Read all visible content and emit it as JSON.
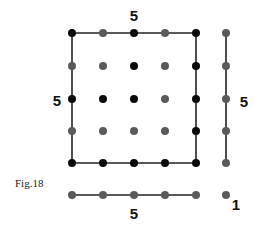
{
  "figure": {
    "caption": "Fig.18",
    "caption_pos": [
      15,
      183
    ],
    "colors": {
      "black": "#0a0a0a",
      "gray": "#5a5a5a",
      "line": "#222222"
    },
    "dot_radius": 4,
    "grid": {
      "cols_x": [
        72,
        103,
        134,
        165,
        196
      ],
      "rows_y": [
        33,
        66,
        99,
        131,
        163
      ],
      "colors": [
        [
          "black",
          "gray",
          "black",
          "gray",
          "black"
        ],
        [
          "gray",
          "gray",
          "black",
          "gray",
          "black"
        ],
        [
          "black",
          "black",
          "black",
          "gray",
          "black"
        ],
        [
          "gray",
          "gray",
          "gray",
          "gray",
          "black"
        ],
        [
          "black",
          "black",
          "black",
          "black",
          "black"
        ]
      ]
    },
    "right_column": {
      "x": 226,
      "ys": [
        33,
        66,
        99,
        131,
        163
      ],
      "color": "gray"
    },
    "bottom_row": {
      "y": 195,
      "xs": [
        72,
        103,
        134,
        165,
        196
      ],
      "color": "gray"
    },
    "single_dot": {
      "x": 226,
      "y": 195,
      "color": "gray"
    },
    "lines": [
      {
        "name": "top-edge",
        "x1": 72,
        "y1": 33,
        "x2": 196,
        "y2": 33
      },
      {
        "name": "left-edge",
        "x1": 72,
        "y1": 33,
        "x2": 72,
        "y2": 163
      },
      {
        "name": "right-edge",
        "x1": 196,
        "y1": 33,
        "x2": 196,
        "y2": 163
      },
      {
        "name": "bottom-edge",
        "x1": 72,
        "y1": 163,
        "x2": 196,
        "y2": 163
      },
      {
        "name": "right-column-line",
        "x1": 226,
        "y1": 33,
        "x2": 226,
        "y2": 163
      },
      {
        "name": "bottom-row-line",
        "x1": 72,
        "y1": 195,
        "x2": 196,
        "y2": 195
      }
    ],
    "labels": [
      {
        "name": "top-count-label",
        "text": "5",
        "x": 134,
        "y": 15
      },
      {
        "name": "left-count-label",
        "text": "5",
        "x": 57,
        "y": 100
      },
      {
        "name": "right-count-label",
        "text": "5",
        "x": 244,
        "y": 101
      },
      {
        "name": "bottom-count-label",
        "text": "5",
        "x": 134,
        "y": 213
      },
      {
        "name": "single-count-label",
        "text": "1",
        "x": 236,
        "y": 204
      }
    ]
  }
}
